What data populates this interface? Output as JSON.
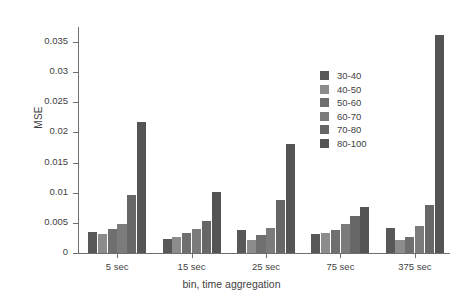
{
  "chart_data": {
    "type": "bar",
    "title": "",
    "xlabel": "bin, time aggregation",
    "ylabel": "MSE",
    "categories": [
      "5 sec",
      "15 sec",
      "25 sec",
      "75 sec",
      "375 sec"
    ],
    "ylim": [
      0,
      0.0375
    ],
    "yticks": [
      0,
      0.005,
      0.01,
      0.015,
      0.02,
      0.025,
      0.03,
      0.035
    ],
    "ytick_labels": [
      "0",
      "0.005",
      "0.01",
      "0.015",
      "0.02",
      "0.025",
      "0.03",
      "0.035"
    ],
    "grid": false,
    "legend_position": "upper right",
    "series": [
      {
        "name": "30-40",
        "color": "#585858",
        "values": [
          0.0035,
          0.0024,
          0.0038,
          0.0032,
          0.0042
        ]
      },
      {
        "name": "40-50",
        "color": "#8c8c8c",
        "values": [
          0.0032,
          0.0026,
          0.0022,
          0.0033,
          0.0021
        ]
      },
      {
        "name": "50-60",
        "color": "#6f6f6f",
        "values": [
          0.004,
          0.0033,
          0.003,
          0.0038,
          0.0026
        ]
      },
      {
        "name": "60-70",
        "color": "#7b7b7b",
        "values": [
          0.0048,
          0.004,
          0.0042,
          0.0048,
          0.0045
        ]
      },
      {
        "name": "70-80",
        "color": "#676767",
        "values": [
          0.0096,
          0.0053,
          0.0088,
          0.0062,
          0.008
        ]
      },
      {
        "name": "80-100",
        "color": "#545454",
        "values": [
          0.0218,
          0.0102,
          0.0181,
          0.0077,
          0.0362
        ]
      }
    ]
  }
}
